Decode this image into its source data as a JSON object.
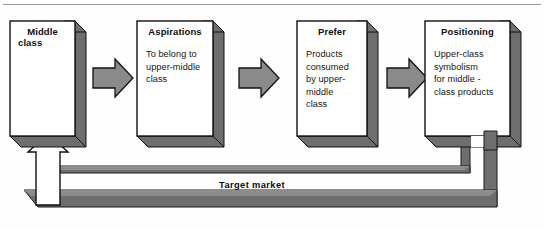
{
  "diagram": {
    "type": "process-flow",
    "title_rule_visible": true,
    "colors": {
      "box_fill": "#ffffff",
      "box_stroke": "#000000",
      "shadow_fill": "#6e6e6e",
      "arrow_fill": "#8a8a8a",
      "arrow_stroke": "#000000",
      "feedback_fill": "#6e6e6e",
      "feedback_arrow_fill": "#ffffff",
      "text": "#101010",
      "rule": "#9a9a9a",
      "background": "#ffffff"
    },
    "boxes": [
      {
        "id": "middle-class",
        "title": "Middle",
        "title_line2": "class",
        "body": ""
      },
      {
        "id": "aspirations",
        "title": "Aspirations",
        "title_line2": "",
        "body": "To belong to\nupper-middle\nclass"
      },
      {
        "id": "prefer",
        "title": "Prefer",
        "title_line2": "",
        "body": "Products\nconsumed\nby upper-\nmiddle\nclass"
      },
      {
        "id": "positioning",
        "title": "Positioning",
        "title_line2": "",
        "body": "Upper-class\nsymbolism\nfor middle -\nclass products"
      }
    ],
    "connectors": [
      {
        "id": "arrow-1",
        "from": "middle-class",
        "to": "aspirations",
        "direction": "right"
      },
      {
        "id": "arrow-2",
        "from": "aspirations",
        "to": "prefer",
        "direction": "right"
      },
      {
        "id": "arrow-3",
        "from": "prefer",
        "to": "positioning",
        "direction": "right"
      }
    ],
    "feedback": {
      "label": "Target market",
      "inner_source": "prefer",
      "outer_source": "positioning",
      "target": "middle-class",
      "arrow_direction": "up"
    }
  }
}
